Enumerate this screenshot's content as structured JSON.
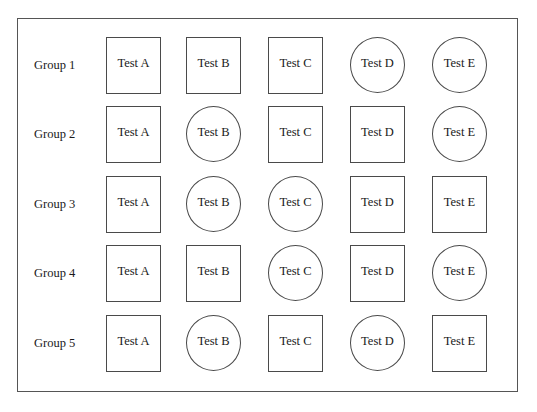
{
  "diagram": {
    "rows": [
      {
        "label": "Group 1",
        "cells": [
          {
            "text": "Test A",
            "shape": "square"
          },
          {
            "text": "Test B",
            "shape": "square"
          },
          {
            "text": "Test C",
            "shape": "square"
          },
          {
            "text": "Test D",
            "shape": "circle"
          },
          {
            "text": "Test E",
            "shape": "circle"
          }
        ]
      },
      {
        "label": "Group 2",
        "cells": [
          {
            "text": "Test A",
            "shape": "square"
          },
          {
            "text": "Test B",
            "shape": "circle"
          },
          {
            "text": "Test C",
            "shape": "square"
          },
          {
            "text": "Test D",
            "shape": "square"
          },
          {
            "text": "Test E",
            "shape": "circle"
          }
        ]
      },
      {
        "label": "Group 3",
        "cells": [
          {
            "text": "Test A",
            "shape": "square"
          },
          {
            "text": "Test B",
            "shape": "circle"
          },
          {
            "text": "Test C",
            "shape": "circle"
          },
          {
            "text": "Test D",
            "shape": "square"
          },
          {
            "text": "Test E",
            "shape": "square"
          }
        ]
      },
      {
        "label": "Group 4",
        "cells": [
          {
            "text": "Test A",
            "shape": "square"
          },
          {
            "text": "Test B",
            "shape": "square"
          },
          {
            "text": "Test C",
            "shape": "circle"
          },
          {
            "text": "Test D",
            "shape": "square"
          },
          {
            "text": "Test E",
            "shape": "circle"
          }
        ]
      },
      {
        "label": "Group 5",
        "cells": [
          {
            "text": "Test A",
            "shape": "square"
          },
          {
            "text": "Test B",
            "shape": "circle"
          },
          {
            "text": "Test C",
            "shape": "square"
          },
          {
            "text": "Test D",
            "shape": "circle"
          },
          {
            "text": "Test E",
            "shape": "square"
          }
        ]
      }
    ],
    "colors": {
      "stroke": "#4a4a4a",
      "text": "#1a1a1a",
      "background": "#ffffff"
    }
  }
}
